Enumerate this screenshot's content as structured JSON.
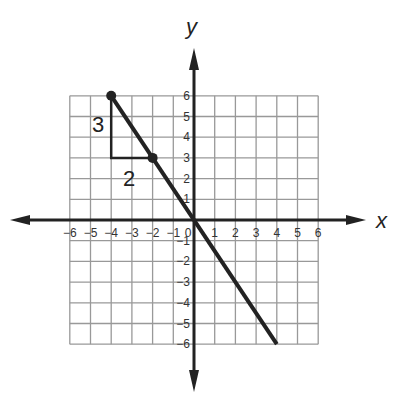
{
  "axes": {
    "x_label": "x",
    "y_label": "y",
    "x_ticks": [
      "−6",
      "−5",
      "−4",
      "−3",
      "−2",
      "−1",
      "0",
      "1",
      "2",
      "3",
      "4",
      "5",
      "6"
    ],
    "y_ticks_pos": [
      "1",
      "2",
      "3",
      "4",
      "5",
      "6"
    ],
    "y_ticks_neg": [
      "−1",
      "−2",
      "−3",
      "−4",
      "−5",
      "−6"
    ],
    "range": [
      -6,
      6
    ]
  },
  "line": {
    "from": [
      -4,
      6
    ],
    "to": [
      4,
      -6
    ],
    "slope": "-3/2"
  },
  "points": [
    [
      -4,
      6
    ],
    [
      -2,
      3
    ]
  ],
  "slope_triangle": {
    "rise_label": "3",
    "run_label": "2"
  },
  "chart_data": {
    "type": "line",
    "title": "",
    "xlabel": "x",
    "ylabel": "y",
    "xlim": [
      -6,
      6
    ],
    "ylim": [
      -6,
      6
    ],
    "grid": true,
    "series": [
      {
        "name": "line",
        "x": [
          -4,
          4
        ],
        "y": [
          6,
          -6
        ]
      }
    ],
    "marked_points": [
      [
        -4,
        6
      ],
      [
        -2,
        3
      ]
    ],
    "annotations": [
      {
        "text": "3",
        "meaning": "rise",
        "position": [
          -4.4,
          4.5
        ]
      },
      {
        "text": "2",
        "meaning": "run",
        "position": [
          -3,
          2.3
        ]
      }
    ]
  }
}
